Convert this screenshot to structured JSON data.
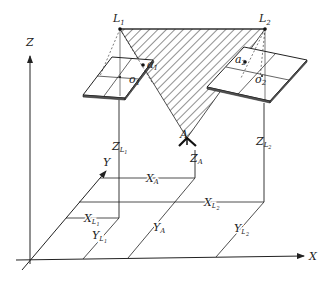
{
  "figure": {
    "type": "photogrammetry-stereo-geometry",
    "axes": {
      "x_label": "X",
      "y_label": "Y",
      "z_label": "Z"
    },
    "exposure_stations": [
      {
        "name": "L",
        "sub": "1"
      },
      {
        "name": "L",
        "sub": "2"
      }
    ],
    "image_points": [
      {
        "name": "a",
        "sub": "1"
      },
      {
        "name": "a",
        "sub": "2"
      }
    ],
    "principal_points": [
      {
        "name": "o",
        "sub": "1"
      },
      {
        "name": "o",
        "sub": "2"
      }
    ],
    "ground_point": {
      "name": "A"
    },
    "heights": [
      {
        "name": "Z",
        "sub": "L1",
        "sub_main": "L",
        "sub_sub": "1"
      },
      {
        "name": "Z",
        "sub": "A"
      },
      {
        "name": "Z",
        "sub": "L2",
        "sub_main": "L",
        "sub_sub": "2"
      }
    ],
    "x_distances": [
      {
        "name": "X",
        "sub": "A"
      },
      {
        "name": "X",
        "sub_main": "L",
        "sub_sub": "1"
      },
      {
        "name": "X",
        "sub_main": "L",
        "sub_sub": "2"
      }
    ],
    "y_distances": [
      {
        "name": "Y",
        "sub_main": "L",
        "sub_sub": "1"
      },
      {
        "name": "Y",
        "sub": "A"
      },
      {
        "name": "Y",
        "sub_main": "L",
        "sub_sub": "2"
      }
    ],
    "colors": {
      "line": "#222222",
      "hatch": "#333333",
      "background": "#ffffff"
    }
  }
}
